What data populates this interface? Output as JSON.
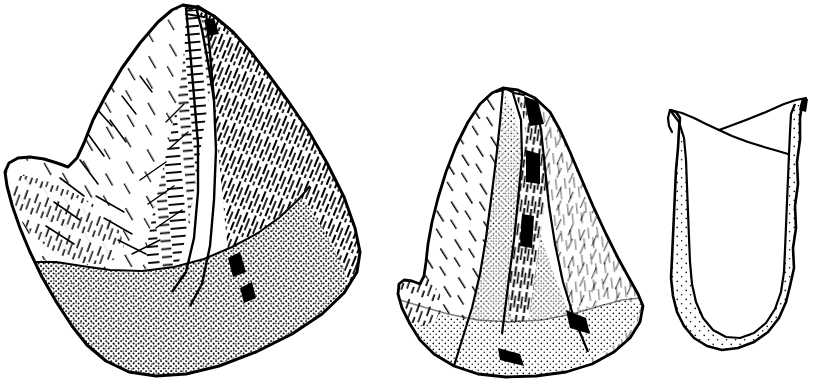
{
  "plate": {
    "title": "Lithic artefact illustration plate",
    "description": "Pen-and-ink archaeological line drawings of three flaked stone artefacts on a plain white ground",
    "background_color": "#ffffff",
    "ink_color": "#000000",
    "canvas": {
      "width": 831,
      "height": 380
    },
    "caption": "",
    "labels": []
  },
  "figures": [
    {
      "id": "figure-1",
      "name": "core-dorsal-view",
      "label": "",
      "view": "dorsal",
      "position": {
        "x": 5,
        "y": 4,
        "width": 358,
        "height": 374
      },
      "outline_color": "#000000",
      "shading": [
        {
          "name": "left-facet-hatching",
          "technique": "line-hatching",
          "density": "sparse",
          "direction": "diagonal-down-right"
        },
        {
          "name": "central-ridge-scar",
          "technique": "ripple-hatching",
          "density": "medium",
          "direction": "horizontal"
        },
        {
          "name": "right-facet-hatching",
          "technique": "line-hatching",
          "density": "dense",
          "direction": "diagonal-down-right"
        },
        {
          "name": "basal-cortex-stipple",
          "technique": "stippling",
          "density": "dense",
          "direction": "none"
        }
      ]
    },
    {
      "id": "figure-2",
      "name": "core-ventral-view",
      "label": "",
      "view": "ventral",
      "position": {
        "x": 394,
        "y": 86,
        "width": 250,
        "height": 292
      },
      "outline_color": "#000000",
      "shading": [
        {
          "name": "left-facet-hatching",
          "technique": "line-hatching",
          "density": "sparse",
          "direction": "diagonal-down-left"
        },
        {
          "name": "central-cortex-stipple",
          "technique": "stippling",
          "density": "graduated",
          "direction": "none"
        },
        {
          "name": "right-ridge-hatching",
          "technique": "line-hatching",
          "density": "dense",
          "direction": "vertical"
        },
        {
          "name": "basal-cortex-stipple",
          "technique": "stippling",
          "density": "medium",
          "direction": "none"
        }
      ]
    },
    {
      "id": "figure-3",
      "name": "core-section-profile",
      "label": "",
      "view": "section",
      "position": {
        "x": 668,
        "y": 96,
        "width": 140,
        "height": 262
      },
      "outline_color": "#000000",
      "shading": [
        {
          "name": "section-cortex-stipple",
          "technique": "stippling",
          "density": "sparse",
          "direction": "none"
        }
      ]
    }
  ]
}
